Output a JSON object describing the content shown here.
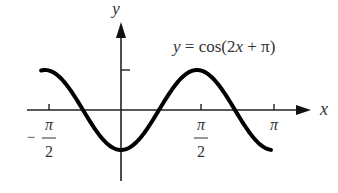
{
  "chart_data": {
    "type": "line",
    "title": "y = cos(2x + π)",
    "equation_label": "y = cos(2x + π)",
    "xlabel": "x",
    "ylabel": "y",
    "x_ticks": [
      {
        "value": -1.5708,
        "label_num": "π",
        "label_den": "2",
        "label_sign": "−"
      },
      {
        "value": 1.5708,
        "label_num": "π",
        "label_den": "2",
        "label_sign": ""
      },
      {
        "value": 3.1416,
        "label_num": "π",
        "label_den": "",
        "label_sign": ""
      }
    ],
    "y_ticks": [
      {
        "value": 1,
        "label": ""
      }
    ],
    "xlim": [
      -1.65,
      3.1
    ],
    "ylim": [
      -1,
      1
    ],
    "series": [
      {
        "name": "cos(2x + π)",
        "x": [
          -1.65,
          -1.1781,
          -0.7854,
          -0.3927,
          0,
          0.3927,
          0.7854,
          1.1781,
          1.5708,
          1.9635,
          2.3562,
          2.7489,
          3.05
        ],
        "values": [
          0.99,
          0.707,
          0,
          -0.707,
          -1,
          -0.707,
          0,
          0.707,
          1,
          0.707,
          0,
          -0.707,
          -0.98
        ]
      }
    ],
    "grid": false,
    "legend": "none"
  },
  "labels": {
    "equation": "y = cos(2x + π)",
    "x_axis": "x",
    "y_axis": "y",
    "pi": "π",
    "two": "2",
    "minus": "−"
  }
}
